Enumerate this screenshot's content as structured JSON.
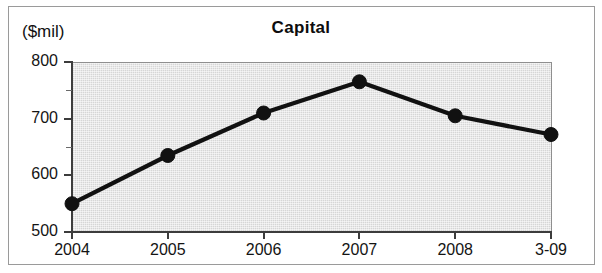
{
  "figure": {
    "unit_label": "($mil)",
    "title": "Capital"
  },
  "chart_data": {
    "type": "line",
    "title": "Capital",
    "subtitle": "",
    "xlabel": "",
    "ylabel": "($mil)",
    "unit": "$mil",
    "categories": [
      "2004",
      "2005",
      "2006",
      "2007",
      "2008",
      "3-09"
    ],
    "values": [
      550,
      635,
      710,
      765,
      705,
      672
    ],
    "series": [
      {
        "name": "Capital",
        "values": [
          550,
          635,
          710,
          765,
          705,
          672
        ]
      }
    ],
    "ylim": [
      500,
      800
    ],
    "yticks": [
      500,
      600,
      700,
      800
    ],
    "ytick_labels": [
      "500",
      "600",
      "700",
      "800"
    ],
    "yminor_ticks": [
      550,
      650,
      750
    ],
    "xtick_labels": [
      "2004",
      "2005",
      "2006",
      "2007",
      "2008",
      "3-09"
    ],
    "grid": false,
    "legend": "none",
    "marker": "filled-circle",
    "line_color": "#111111",
    "plot_background": "#d6d6d6",
    "figure_background": "#ffffff"
  },
  "axis": {
    "y_labels": [
      "800",
      "700",
      "600",
      "500"
    ],
    "x_labels": [
      "2004",
      "2005",
      "2006",
      "2007",
      "2008",
      "3-09"
    ]
  }
}
